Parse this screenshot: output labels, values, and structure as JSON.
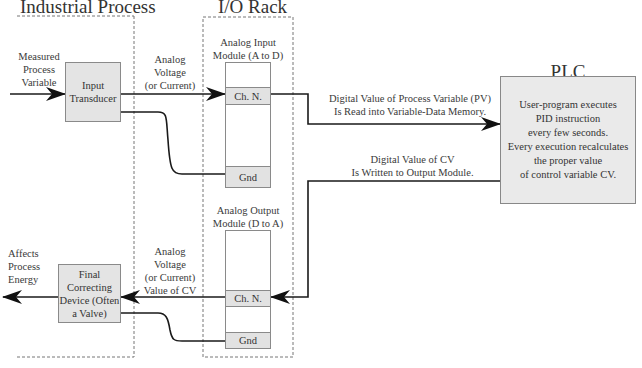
{
  "sections": {
    "industrial_process": {
      "title": "Industrial Process"
    },
    "io_rack": {
      "title": "I/O Rack"
    },
    "plc": {
      "title_line1": "PLC",
      "title_line2": "Processor"
    }
  },
  "input_side": {
    "measured_pv_label": [
      "Measured",
      "Process",
      "Variable"
    ],
    "input_transducer": [
      "Input",
      "Transducer"
    ],
    "analog_voltage_label": [
      "Analog",
      "Voltage",
      "(or Current)"
    ],
    "input_module_label": [
      "Analog Input",
      "Module (A to D)"
    ],
    "input_module_channel": "Ch. N.",
    "input_module_gnd": "Gnd"
  },
  "plc_links": {
    "pv_read_label": [
      "Digital Value of Process Variable (PV)",
      "Is Read into Variable-Data Memory."
    ],
    "cv_write_label": [
      "Digital Value of CV",
      "Is Written to Output Module."
    ]
  },
  "plc_box_text": [
    "User-program executes",
    "PID instruction",
    "every few seconds.",
    "Every execution recalculates",
    "the proper value",
    "of control variable CV."
  ],
  "output_side": {
    "output_module_label": [
      "Analog Output",
      "Module (D to A)"
    ],
    "output_module_channel": "Ch. N.",
    "output_module_gnd": "Gnd",
    "analog_cv_label": [
      "Analog",
      "Voltage",
      "(or Current)",
      "Value of CV"
    ],
    "final_device": [
      "Final",
      "Correcting",
      "Device (Often",
      "a Valve)"
    ],
    "affects_label": [
      "Affects",
      "Process",
      "Energy"
    ]
  },
  "colors": {
    "box_fill": "#e4e4e4",
    "plc_fill": "#eaeaea",
    "line": "#1a1a1a",
    "dashed_border": "#777777"
  }
}
